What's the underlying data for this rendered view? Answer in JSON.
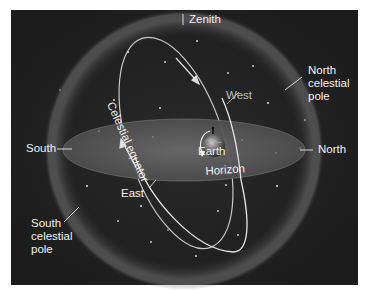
{
  "figure": {
    "background_color": "#222222",
    "panel_border_color": "#ffffff"
  },
  "labels": {
    "zenith": "Zenith",
    "north_celestial_pole": [
      "North",
      "celestial",
      "pole"
    ],
    "south_celestial_pole": [
      "South",
      "celestial",
      "pole"
    ],
    "south": "South",
    "north": "North",
    "west": "West",
    "east": "East",
    "earth": "Earth",
    "horizon": "Horizon",
    "celestial_equator": "Celestial equator"
  },
  "elements": {
    "celestial_sphere": {
      "shape": "circle",
      "glow_color": "#8a8a8a"
    },
    "horizon_plane": {
      "shape": "ellipse",
      "fill": "#5c5c5c"
    },
    "celestial_equator_path": {
      "shape": "tilted-ellipse",
      "stroke": "#e8e8e8"
    },
    "earth": {
      "shape": "globe",
      "rotation_arrow": "counter-clockwise"
    },
    "motion_arrows": [
      "equator-arrow-upper",
      "equator-arrow-left"
    ]
  }
}
